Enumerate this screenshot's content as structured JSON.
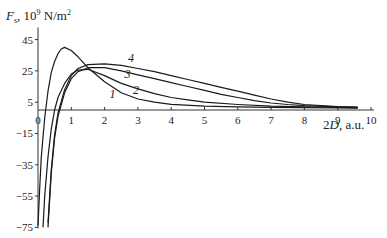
{
  "chart_data": {
    "type": "line",
    "title": "",
    "ylabel": "F_s, 10^9 N/m^2",
    "ylabel_parts": {
      "main": "F",
      "sub": "s",
      "unit": ", 10",
      "exp": "9",
      "unit2": " N/m",
      "exp2": "2"
    },
    "xlabel": "2D, a.u.",
    "xlabel_parts": {
      "italic": "D",
      "prefix": "2",
      "suffix": ", a.u."
    },
    "xlim": [
      0,
      10
    ],
    "ylim": [
      -75,
      45
    ],
    "x_ticks": [
      0,
      1,
      2,
      3,
      4,
      5,
      6,
      7,
      8,
      9,
      10
    ],
    "x_tick_labels": [
      "0",
      "1",
      "2",
      "3",
      "4",
      "5",
      "6",
      "7",
      "8",
      "9",
      "10"
    ],
    "y_ticks": [
      45,
      25,
      5,
      -15,
      -35,
      -55,
      -75
    ],
    "y_tick_labels": [
      "45",
      "25",
      "5",
      "−15",
      "−35",
      "−55",
      "−75"
    ],
    "grid": false,
    "legend": "inline curve labels",
    "series": [
      {
        "name": "1",
        "label_pos": [
          2.15,
          7.5
        ],
        "x": [
          0.0,
          0.05,
          0.1,
          0.2,
          0.3,
          0.4,
          0.5,
          0.6,
          0.7,
          0.8,
          1.0,
          1.2,
          1.5,
          2.0,
          2.5,
          3.0,
          3.5,
          4.0,
          5.0,
          6.0,
          7.0,
          8.0,
          9.0,
          9.6
        ],
        "y": [
          -74,
          -50,
          -30,
          -5,
          12,
          24,
          31,
          36,
          39,
          40,
          38,
          34,
          27,
          18,
          11,
          7,
          5,
          3.6,
          2.5,
          2.0,
          1.7,
          1.5,
          1.3,
          1.2
        ]
      },
      {
        "name": "2",
        "label_pos": [
          2.85,
          10.5
        ],
        "x": [
          0.15,
          0.2,
          0.3,
          0.4,
          0.5,
          0.6,
          0.8,
          1.0,
          1.2,
          1.5,
          2.0,
          2.5,
          3.0,
          3.5,
          4.0,
          4.5,
          5.0,
          6.0,
          7.0,
          8.0,
          9.0,
          9.6
        ],
        "y": [
          -75,
          -55,
          -30,
          -12,
          0,
          8,
          17,
          23,
          25.5,
          26,
          22,
          17,
          13.5,
          10.5,
          8,
          6.5,
          5,
          3.5,
          2.5,
          2,
          1.7,
          1.5
        ]
      },
      {
        "name": "3",
        "label_pos": [
          2.6,
          20.5
        ],
        "x": [
          0.3,
          0.4,
          0.5,
          0.6,
          0.8,
          1.0,
          1.2,
          1.5,
          2.0,
          2.5,
          3.0,
          3.5,
          4.0,
          4.5,
          5.0,
          5.5,
          6.0,
          6.5,
          7.0,
          7.5,
          8.0,
          9.0,
          9.6
        ],
        "y": [
          -75,
          -40,
          -18,
          -4,
          11,
          20,
          24.5,
          27,
          27,
          25,
          22.5,
          20,
          17.5,
          15,
          12.5,
          10,
          8,
          6,
          4.5,
          3.5,
          2.8,
          2,
          1.7
        ]
      },
      {
        "name": "4",
        "label_pos": [
          2.7,
          30.5
        ],
        "x": [
          0.3,
          0.4,
          0.5,
          0.6,
          0.8,
          1.0,
          1.2,
          1.5,
          2.0,
          2.5,
          3.0,
          3.5,
          4.0,
          4.5,
          5.0,
          5.5,
          6.0,
          6.5,
          7.0,
          7.5,
          8.0,
          9.0,
          9.6
        ],
        "y": [
          -72,
          -38,
          -16,
          -2,
          13,
          22,
          26.5,
          29,
          29.5,
          28.5,
          26.5,
          24.5,
          22,
          19.5,
          17,
          14.5,
          12,
          9.5,
          7,
          5,
          3.5,
          2.2,
          1.8
        ]
      }
    ]
  }
}
